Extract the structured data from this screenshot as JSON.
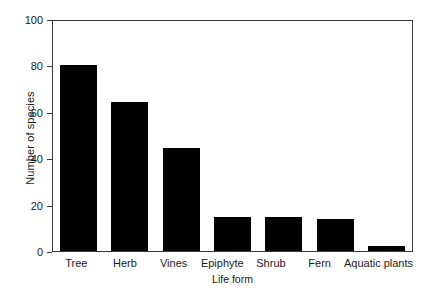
{
  "chart_data": {
    "type": "bar",
    "title": "",
    "subtitle": "",
    "xlabel": "Life form",
    "ylabel": "Number of species",
    "categories": [
      "Tree",
      "Herb",
      "Vines",
      "Epiphyte",
      "Shrub",
      "Fern",
      "Aquatic plants"
    ],
    "values": [
      81,
      65,
      45,
      15,
      15,
      14,
      2
    ],
    "ylim": [
      0,
      100
    ],
    "yticks": [
      0,
      20,
      40,
      60,
      80,
      100
    ],
    "ytick_labels": [
      "0",
      "20",
      "40",
      "60",
      "80",
      "100"
    ],
    "grid": false,
    "legend": null,
    "bar_color": "#000000",
    "axis_color": "#3a3a3a",
    "background_color": "#ffffff",
    "annotations": []
  }
}
